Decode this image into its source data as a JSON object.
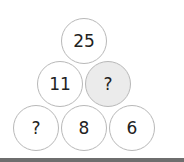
{
  "puzzle": {
    "top": {
      "value": "25"
    },
    "middle": [
      {
        "value": "11",
        "shaded": false
      },
      {
        "value": "?",
        "shaded": true
      }
    ],
    "bottom": [
      {
        "value": "?"
      },
      {
        "value": "8"
      },
      {
        "value": "6"
      }
    ]
  }
}
